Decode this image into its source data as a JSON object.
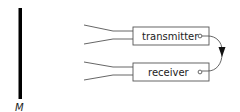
{
  "diagram": {
    "mirror": {
      "label": "M",
      "icon": "mirror-bar"
    },
    "components": [
      {
        "id": "transmitter",
        "label": "transmitter",
        "port": "output-port"
      },
      {
        "id": "receiver",
        "label": "receiver",
        "port": "input-port"
      }
    ],
    "connection": {
      "from": "transmitter",
      "to": "receiver",
      "icon": "curved-arrow-down"
    },
    "colors": {
      "stroke": "#555555",
      "mirror": "#000000",
      "text": "#222222",
      "background": "#ffffff"
    }
  }
}
